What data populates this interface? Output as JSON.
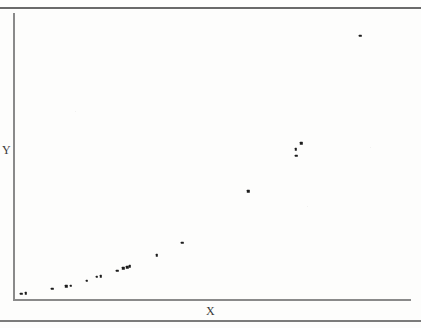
{
  "figure": {
    "kind": "scanned-scatter-figure",
    "page_rules": [
      "top-horizontal-rule",
      "bottom-horizontal-rule"
    ],
    "ink_color": "#1c1c1c",
    "axis_color": "#8a8a8a",
    "rule_color": "#6a6a6a",
    "background_color": "#fdfdfc"
  },
  "chart_data": {
    "type": "scatter",
    "title": "",
    "subtitle": "",
    "xlabel": "X",
    "ylabel": "Y",
    "xlim": [
      0,
      100
    ],
    "ylim": [
      0,
      100
    ],
    "grid": false,
    "legend": null,
    "annotations": [],
    "marker": {
      "shape": "square",
      "size": 2.4,
      "color": "#1c1c1c"
    },
    "axis_style": {
      "top_spine": false,
      "right_spine": false,
      "left_spine": true,
      "bottom_spine": true,
      "xticks": [],
      "yticks": [],
      "xticklabels": [],
      "yticklabels": []
    },
    "x": [
      1.6,
      2.8,
      9.4,
      13.0,
      14.1,
      18.1,
      20.6,
      21.6,
      25.8,
      27.3,
      28.4,
      29.0,
      35.8,
      42.2,
      58.9,
      70.9,
      71.0,
      72.3,
      87.2
    ],
    "y": [
      1.8,
      2.0,
      3.5,
      4.5,
      4.6,
      6.3,
      7.8,
      8.0,
      9.9,
      10.7,
      11.1,
      11.4,
      15.3,
      19.6,
      37.6,
      52.4,
      50.1,
      54.4,
      92.1
    ],
    "points": [
      {
        "x": 1.6,
        "y": 1.8
      },
      {
        "x": 2.8,
        "y": 2.0
      },
      {
        "x": 9.4,
        "y": 3.5
      },
      {
        "x": 13.0,
        "y": 4.5
      },
      {
        "x": 14.1,
        "y": 4.6
      },
      {
        "x": 18.1,
        "y": 6.3
      },
      {
        "x": 20.6,
        "y": 7.8
      },
      {
        "x": 21.6,
        "y": 8.0
      },
      {
        "x": 25.8,
        "y": 9.9
      },
      {
        "x": 27.3,
        "y": 10.7
      },
      {
        "x": 28.4,
        "y": 11.1
      },
      {
        "x": 29.0,
        "y": 11.4
      },
      {
        "x": 35.8,
        "y": 15.3
      },
      {
        "x": 42.2,
        "y": 19.6
      },
      {
        "x": 58.9,
        "y": 37.6
      },
      {
        "x": 70.9,
        "y": 52.4
      },
      {
        "x": 71.0,
        "y": 50.1
      },
      {
        "x": 72.3,
        "y": 54.4
      },
      {
        "x": 87.2,
        "y": 92.1
      }
    ]
  }
}
